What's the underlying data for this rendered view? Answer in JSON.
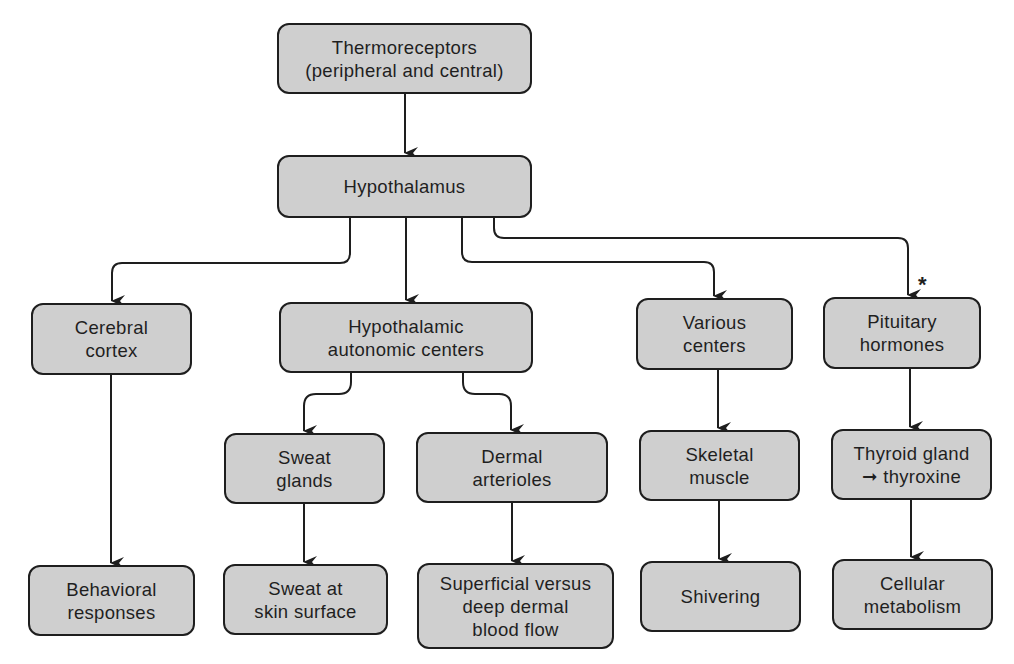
{
  "diagram": {
    "type": "flowchart",
    "colors": {
      "box_fill": "#cfcfcf",
      "box_border": "#1e1e1e",
      "line": "#1e1e1e",
      "text": "#1f1f1f",
      "background": "#ffffff"
    },
    "nodes": {
      "thermoreceptors": "Thermoreceptors\n(peripheral and central)",
      "hypothalamus": "Hypothalamus",
      "cerebral_cortex": "Cerebral\ncortex",
      "hypothalamic_autonomic": "Hypothalamic\nautonomic centers",
      "various_centers": "Various\ncenters",
      "pituitary_hormones": "Pituitary\nhormones",
      "sweat_glands": "Sweat\nglands",
      "dermal_arterioles": "Dermal\narterioles",
      "skeletal_muscle": "Skeletal\nmuscle",
      "thyroid_gland": "Thyroid gland\n➞ thyroxine",
      "behavioral_responses": "Behavioral\nresponses",
      "sweat_skin_surface": "Sweat at\nskin surface",
      "dermal_blood_flow": "Superficial versus\ndeep dermal\nblood flow",
      "shivering": "Shivering",
      "cellular_metabolism": "Cellular\nmetabolism"
    },
    "edges": [
      [
        "thermoreceptors",
        "hypothalamus"
      ],
      [
        "hypothalamus",
        "cerebral_cortex"
      ],
      [
        "hypothalamus",
        "hypothalamic_autonomic"
      ],
      [
        "hypothalamus",
        "various_centers"
      ],
      [
        "hypothalamus",
        "pituitary_hormones"
      ],
      [
        "cerebral_cortex",
        "behavioral_responses"
      ],
      [
        "hypothalamic_autonomic",
        "sweat_glands"
      ],
      [
        "hypothalamic_autonomic",
        "dermal_arterioles"
      ],
      [
        "sweat_glands",
        "sweat_skin_surface"
      ],
      [
        "dermal_arterioles",
        "dermal_blood_flow"
      ],
      [
        "various_centers",
        "skeletal_muscle"
      ],
      [
        "skeletal_muscle",
        "shivering"
      ],
      [
        "pituitary_hormones",
        "thyroid_gland"
      ],
      [
        "thyroid_gland",
        "cellular_metabolism"
      ]
    ],
    "annotations": {
      "pituitary_marker": "*"
    }
  }
}
